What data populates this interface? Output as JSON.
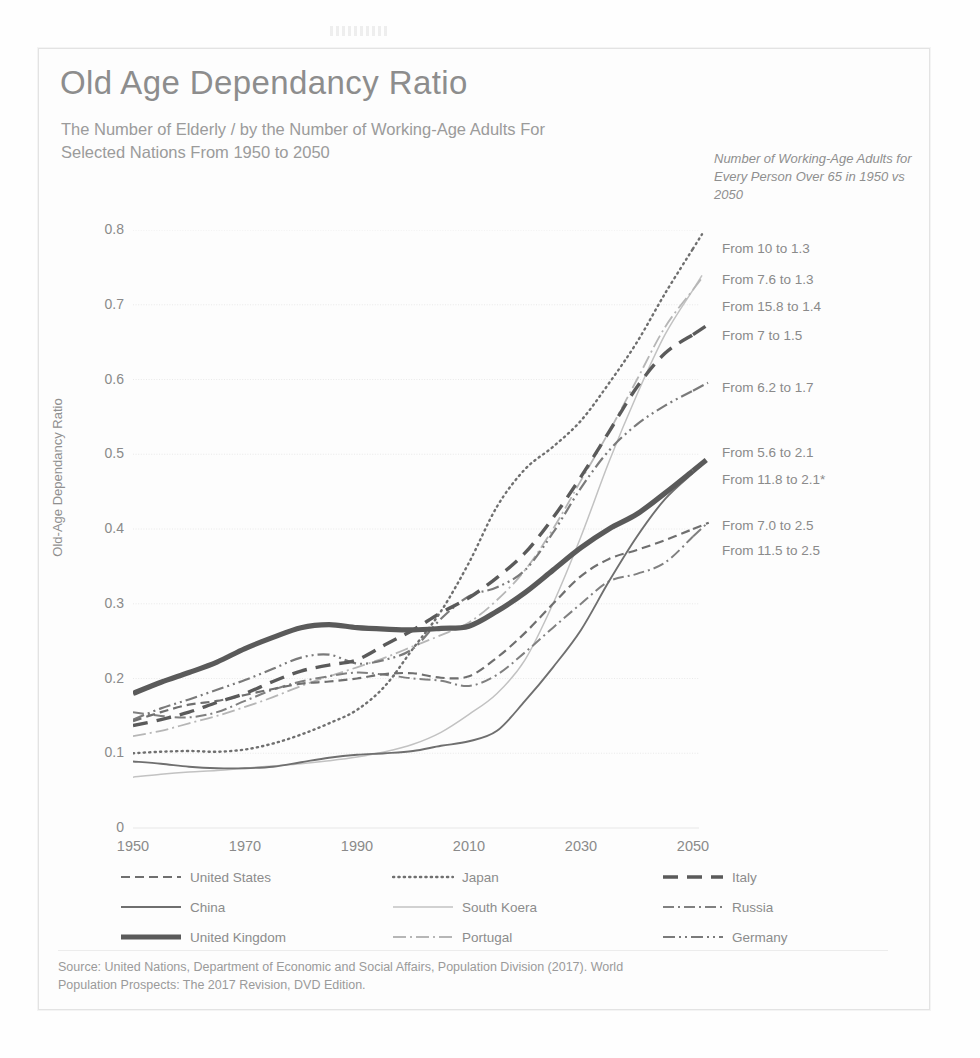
{
  "title": "Old Age Dependancy Ratio",
  "subtitle": "The Number of Elderly / by the Number of Working-Age Adults For Selected Nations From 1950 to 2050",
  "annotation_header": "Number of Working-Age Adults for Every Person Over 65 in 1950 vs 2050",
  "annotations": [
    {
      "text": "From 10 to 1.3",
      "y": 241
    },
    {
      "text": "From 7.6 to 1.3",
      "y": 272
    },
    {
      "text": "From 15.8 to 1.4",
      "y": 299
    },
    {
      "text": "From 7 to 1.5",
      "y": 328
    },
    {
      "text": "From 6.2 to 1.7",
      "y": 380
    },
    {
      "text": "From 5.6 to 2.1",
      "y": 445
    },
    {
      "text": "From 11.8 to 2.1*",
      "y": 472
    },
    {
      "text": "From 7.0 to 2.5",
      "y": 518
    },
    {
      "text": "From 11.5 to 2.5",
      "y": 543
    }
  ],
  "legend": {
    "rows": [
      [
        {
          "label": "United States",
          "style": "dash",
          "name": "united-states"
        },
        {
          "label": "Japan",
          "style": "dot",
          "name": "japan"
        },
        {
          "label": "Italy",
          "style": "longdash",
          "name": "italy"
        }
      ],
      [
        {
          "label": "China",
          "style": "solid-thin",
          "name": "china"
        },
        {
          "label": "South Koera",
          "style": "solid-light",
          "name": "south-koera"
        },
        {
          "label": "Russia",
          "style": "dashdot",
          "name": "russia"
        }
      ],
      [
        {
          "label": "United Kingdom",
          "style": "solid-thick",
          "name": "united-kingdom"
        },
        {
          "label": "Portugal",
          "style": "lightdashdot",
          "name": "portugal"
        },
        {
          "label": "Germany",
          "style": "dashdotdot",
          "name": "germany"
        }
      ]
    ]
  },
  "source": "Source: United Nations, Department of Economic and Social Affairs, Population Division (2017). World Population Prospects: The 2017 Revision, DVD Edition.",
  "colors": {
    "text": "#8a8a8a",
    "grid": "#e7e7e7",
    "dark": "#5a5a5a",
    "mid": "#6f6f6f",
    "light": "#b9b9b9"
  },
  "chart_data": {
    "type": "line",
    "title": "Old Age Dependancy Ratio",
    "xlabel": "",
    "ylabel": "Old-Age Dependancy Ratio",
    "xlim": [
      1950,
      2050
    ],
    "ylim": [
      0,
      0.8
    ],
    "xticks": [
      1950,
      1970,
      1990,
      2010,
      2030,
      2050
    ],
    "yticks": [
      0,
      0.1,
      0.2,
      0.3,
      0.4,
      0.5,
      0.6,
      0.7,
      0.8
    ],
    "ytick_labels": [
      "0",
      "0.1",
      "0.2",
      "0.3",
      "0.4",
      "0.5",
      "0.6",
      "0.7",
      "0.8"
    ],
    "grid": true,
    "legend_position": "bottom",
    "x": [
      1950,
      1955,
      1960,
      1965,
      1970,
      1975,
      1980,
      1985,
      1990,
      1995,
      2000,
      2005,
      2010,
      2015,
      2020,
      2025,
      2030,
      2035,
      2040,
      2045,
      2050
    ],
    "series": [
      {
        "name": "United States",
        "style": "dash",
        "color": "#6f6f6f",
        "ratio_1950": 0.143,
        "ratio_2050": 0.4,
        "working_age_1950": 7.0,
        "working_age_2050": 2.5,
        "values": [
          0.143,
          0.155,
          0.165,
          0.17,
          0.178,
          0.186,
          0.193,
          0.196,
          0.2,
          0.206,
          0.207,
          0.201,
          0.203,
          0.228,
          0.261,
          0.3,
          0.337,
          0.36,
          0.372,
          0.385,
          0.4
        ]
      },
      {
        "name": "Japan",
        "style": "dot",
        "color": "#6f6f6f",
        "ratio_1950": 0.1,
        "ratio_2050": 0.775,
        "working_age_1950": 10.0,
        "working_age_2050": 1.3,
        "values": [
          0.1,
          0.102,
          0.103,
          0.102,
          0.105,
          0.113,
          0.125,
          0.14,
          0.158,
          0.19,
          0.24,
          0.29,
          0.355,
          0.43,
          0.48,
          0.51,
          0.545,
          0.595,
          0.65,
          0.715,
          0.775
        ]
      },
      {
        "name": "Italy",
        "style": "longdash",
        "color": "#5a5a5a",
        "ratio_1950": 0.137,
        "ratio_2050": 0.66,
        "working_age_1950": 7.6,
        "working_age_2050": 1.3,
        "values": [
          0.137,
          0.145,
          0.155,
          0.168,
          0.18,
          0.196,
          0.21,
          0.218,
          0.225,
          0.245,
          0.265,
          0.288,
          0.308,
          0.335,
          0.368,
          0.415,
          0.47,
          0.53,
          0.59,
          0.635,
          0.66
        ]
      },
      {
        "name": "China",
        "style": "solid-thin",
        "color": "#6f6f6f",
        "ratio_1950": 0.089,
        "ratio_2050": 0.475,
        "working_age_1950": 11.5,
        "working_age_2050": 2.5,
        "values": [
          0.089,
          0.086,
          0.082,
          0.08,
          0.08,
          0.082,
          0.088,
          0.094,
          0.098,
          0.1,
          0.103,
          0.11,
          0.116,
          0.13,
          0.17,
          0.215,
          0.265,
          0.33,
          0.39,
          0.44,
          0.475
        ]
      },
      {
        "name": "South Koera",
        "style": "solid-light",
        "color": "#c2c2c2",
        "ratio_1950": 0.068,
        "ratio_2050": 0.72,
        "working_age_1950": 15.8,
        "working_age_2050": 1.4,
        "values": [
          0.068,
          0.072,
          0.075,
          0.077,
          0.08,
          0.083,
          0.086,
          0.09,
          0.095,
          0.102,
          0.112,
          0.128,
          0.152,
          0.18,
          0.225,
          0.3,
          0.39,
          0.49,
          0.58,
          0.66,
          0.72
        ]
      },
      {
        "name": "Russia",
        "style": "dashdot",
        "color": "#808080",
        "ratio_1950": 0.155,
        "ratio_2050": 0.39,
        "working_age_1950": 5.6,
        "working_age_2050": 2.1,
        "values": [
          0.155,
          0.15,
          0.148,
          0.155,
          0.17,
          0.185,
          0.196,
          0.203,
          0.208,
          0.205,
          0.2,
          0.197,
          0.19,
          0.205,
          0.235,
          0.268,
          0.3,
          0.33,
          0.34,
          0.355,
          0.39
        ]
      },
      {
        "name": "United Kingdom",
        "style": "solid-thick",
        "color": "#5a5a5a",
        "ratio_1950": 0.18,
        "ratio_2050": 0.478,
        "working_age_1950": 5.6,
        "working_age_2050": 2.1,
        "values": [
          0.18,
          0.195,
          0.208,
          0.222,
          0.24,
          0.255,
          0.268,
          0.272,
          0.268,
          0.266,
          0.265,
          0.267,
          0.27,
          0.29,
          0.315,
          0.345,
          0.375,
          0.4,
          0.42,
          0.448,
          0.478
        ]
      },
      {
        "name": "Portugal",
        "style": "lightdashdot",
        "color": "#b6b6b6",
        "ratio_1950": 0.123,
        "ratio_2050": 0.72,
        "working_age_1950": 7.0,
        "working_age_2050": 1.5,
        "values": [
          0.123,
          0.13,
          0.14,
          0.15,
          0.162,
          0.175,
          0.19,
          0.203,
          0.215,
          0.228,
          0.243,
          0.258,
          0.275,
          0.305,
          0.345,
          0.4,
          0.465,
          0.53,
          0.6,
          0.67,
          0.72
        ]
      },
      {
        "name": "Germany",
        "style": "dashdotdot",
        "color": "#7a7a7a",
        "ratio_1950": 0.145,
        "ratio_2050": 0.585,
        "working_age_1950": 6.2,
        "working_age_2050": 1.7,
        "values": [
          0.145,
          0.16,
          0.172,
          0.185,
          0.198,
          0.213,
          0.228,
          0.232,
          0.22,
          0.225,
          0.24,
          0.28,
          0.31,
          0.322,
          0.345,
          0.395,
          0.455,
          0.505,
          0.54,
          0.565,
          0.585
        ]
      }
    ]
  }
}
